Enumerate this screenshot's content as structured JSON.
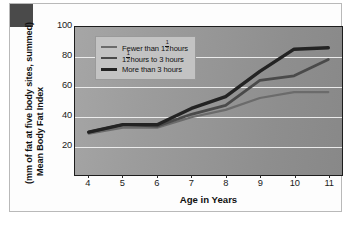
{
  "figure": {
    "y_axis_title_line1": "Mean Body Fat Index",
    "y_axis_title_line2": "(mm of fat at five body sites, summed)",
    "x_axis_title": "Age in Years"
  },
  "legend": {
    "items": [
      {
        "label_pre": "Fewer than 1",
        "frac_num": "1",
        "frac_den": "2",
        "label_post": "hours",
        "color": "#6b6b6b",
        "width": 2.2
      },
      {
        "label_pre": "1",
        "frac_num": "1",
        "frac_den": "2",
        "label_post": "hours to 3 hours",
        "color": "#4a4a4a",
        "width": 2.8
      },
      {
        "label_pre": "More than 3 hours",
        "frac_num": "",
        "frac_den": "",
        "label_post": "",
        "color": "#232323",
        "width": 3.4
      }
    ]
  },
  "chart_data": {
    "type": "line",
    "title": "",
    "xlabel": "Age in Years",
    "ylabel": "Mean Body Fat Index (mm of fat at five body sites, summed)",
    "x": [
      4,
      5,
      6,
      7,
      8,
      9,
      10,
      11
    ],
    "xlim": [
      3.6,
      11.4
    ],
    "ylim": [
      0,
      100
    ],
    "yticks": [
      20,
      40,
      60,
      80,
      100
    ],
    "xticks": [
      4,
      5,
      6,
      7,
      8,
      9,
      10,
      11
    ],
    "grid": "horizontal",
    "legend_position": "top-left-inside",
    "series": [
      {
        "name": "Fewer than 1½ hours",
        "color": "#6b6b6b",
        "width": 2.2,
        "values": [
          28,
          32,
          32,
          39,
          44,
          52,
          56,
          56
        ]
      },
      {
        "name": "1½ hours to 3 hours",
        "color": "#4a4a4a",
        "width": 2.8,
        "values": [
          29,
          34,
          33,
          41,
          47,
          64,
          67,
          78
        ]
      },
      {
        "name": "More than 3 hours",
        "color": "#232323",
        "width": 3.4,
        "values": [
          29,
          34,
          34,
          45,
          53,
          70,
          85,
          86
        ]
      }
    ]
  }
}
